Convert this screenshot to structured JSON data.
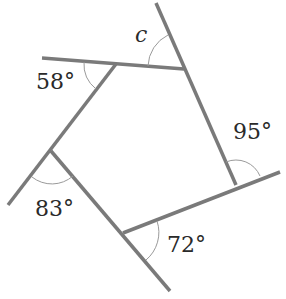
{
  "diagram": {
    "type": "pentagon-exterior-angles",
    "line_color": "#7a7a7a",
    "arc_color": "#9a9a9a",
    "text_color": "#2a2a2a",
    "vertices": [
      {
        "id": "top-left",
        "x": 116,
        "y": 64
      },
      {
        "id": "top-right",
        "x": 184,
        "y": 69
      },
      {
        "id": "right",
        "x": 236,
        "y": 185
      },
      {
        "id": "bottom",
        "x": 123,
        "y": 233
      },
      {
        "id": "left",
        "x": 51,
        "y": 151
      }
    ],
    "angles": [
      {
        "id": "angle-c",
        "label": "c",
        "is_variable": true
      },
      {
        "id": "angle-95",
        "label": "95°"
      },
      {
        "id": "angle-72",
        "label": "72°"
      },
      {
        "id": "angle-83",
        "label": "83°"
      },
      {
        "id": "angle-58",
        "label": "58°"
      }
    ]
  }
}
